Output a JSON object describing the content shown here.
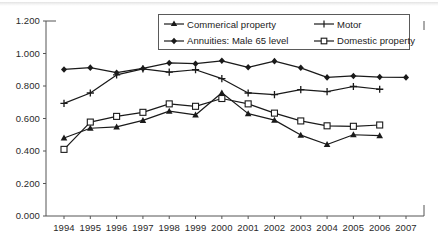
{
  "chart_data": {
    "type": "line",
    "title": "",
    "xlabel": "",
    "ylabel": "",
    "x": [
      1994,
      1995,
      1996,
      1997,
      1998,
      1999,
      2000,
      2001,
      2002,
      2003,
      2004,
      2005,
      2006,
      2007
    ],
    "categories": [
      "1994",
      "1995",
      "1996",
      "1997",
      "1998",
      "1999",
      "2000",
      "2001",
      "2002",
      "2003",
      "2004",
      "2005",
      "2006",
      "2007"
    ],
    "ylim": [
      0.0,
      1.2
    ],
    "ytick_values": [
      0.0,
      0.2,
      0.4,
      0.6,
      0.8,
      1.0,
      1.2
    ],
    "ytick_labels": [
      "0.000",
      "0.200",
      "0.400",
      "0.600",
      "0.800",
      "1.000",
      "1.200"
    ],
    "grid": false,
    "legend_position": "top-center-inside",
    "series": [
      {
        "name": "Commerical property",
        "marker": "triangle",
        "color": "#1a1a1a",
        "values": [
          0.48,
          0.54,
          0.548,
          0.588,
          0.645,
          0.622,
          0.758,
          0.63,
          0.59,
          0.498,
          0.44,
          0.5,
          0.495,
          null
        ]
      },
      {
        "name": "Motor",
        "marker": "plus",
        "color": "#1a1a1a",
        "values": [
          0.693,
          0.757,
          0.868,
          0.905,
          0.885,
          0.9,
          0.845,
          0.757,
          0.747,
          0.778,
          0.766,
          0.797,
          0.78,
          null
        ]
      },
      {
        "name": "Annuities: Male 65 level",
        "marker": "diamond",
        "color": "#1a1a1a",
        "values": [
          0.902,
          0.913,
          0.882,
          0.908,
          0.942,
          0.937,
          0.955,
          0.915,
          0.953,
          0.912,
          0.853,
          0.862,
          0.855,
          0.853
        ]
      },
      {
        "name": "Domestic property",
        "marker": "square-open",
        "color": "#1a1a1a",
        "values": [
          0.41,
          0.578,
          0.613,
          0.638,
          0.69,
          0.675,
          0.723,
          0.69,
          0.633,
          0.585,
          0.555,
          0.552,
          0.56,
          null
        ]
      }
    ]
  },
  "legend": {
    "entries": [
      {
        "label": "Commerical property",
        "marker": "triangle"
      },
      {
        "label": "Motor",
        "marker": "plus"
      },
      {
        "label": "Annuities: Male 65 level",
        "marker": "diamond"
      },
      {
        "label": "Domestic property",
        "marker": "square-open"
      }
    ]
  },
  "axes": {
    "y_labels": [
      "1.200",
      "1.000",
      "0.800",
      "0.600",
      "0.400",
      "0.200",
      "0.000"
    ],
    "x_labels": [
      "1994",
      "1995",
      "1996",
      "1997",
      "1998",
      "1999",
      "2000",
      "2001",
      "2002",
      "2003",
      "2004",
      "2005",
      "2006",
      "2007"
    ]
  },
  "style": {
    "line_color": "#1a1a1a",
    "axis_color": "#555555",
    "background": "#ffffff"
  }
}
